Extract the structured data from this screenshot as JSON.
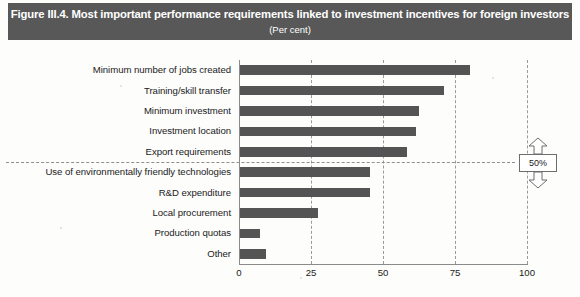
{
  "figure": {
    "title": "Figure III.4. Most important performance requirements linked to investment incentives for foreign investors",
    "subtitle": "(Per cent)"
  },
  "annotation": {
    "label": "50%",
    "arrow_up_icon": "arrow-up-icon",
    "arrow_down_icon": "arrow-down-icon"
  },
  "chart_data": {
    "type": "bar",
    "orientation": "horizontal",
    "title": "Figure III.4. Most important performance requirements linked to investment incentives for foreign investors",
    "subtitle": "(Per cent)",
    "xlabel": "",
    "ylabel": "",
    "xlim": [
      0,
      100
    ],
    "xticks": [
      0,
      25,
      50,
      75,
      100
    ],
    "xtick_labels": [
      "0",
      "25",
      "50",
      "75",
      "100"
    ],
    "grid": "vertical-dashed",
    "legend": "none",
    "reference_line": {
      "value": 50,
      "label": "50%",
      "style": "horizontal-dashed"
    },
    "bar_color": "#545454",
    "categories": [
      "Minimum number of jobs created",
      "Training/skill transfer",
      "Minimum investment",
      "Investment location",
      "Export requirements",
      "Use of environmentally friendly technologies",
      "R&D expenditure",
      "Local procurement",
      "Production quotas",
      "Other"
    ],
    "values": [
      80,
      71,
      62,
      61,
      58,
      45,
      45,
      27,
      7,
      9
    ]
  }
}
